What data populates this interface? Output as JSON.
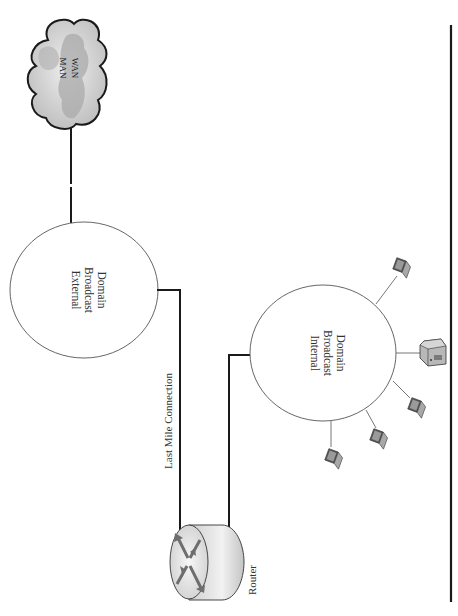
{
  "diagram": {
    "cloud": {
      "lines": [
        "MAN",
        "WAN"
      ]
    },
    "external_domain": {
      "lines": [
        "External",
        "Broadcast",
        "Domain"
      ]
    },
    "internal_domain": {
      "lines": [
        "Internal",
        "Broadcast",
        "Domain"
      ]
    },
    "last_mile_label": "Last Mile Connection",
    "router_label": "Router",
    "devices": [
      {
        "type": "laptop"
      },
      {
        "type": "server"
      },
      {
        "type": "laptop"
      },
      {
        "type": "laptop"
      },
      {
        "type": "laptop"
      }
    ]
  },
  "colors": {
    "line": "#1a1a1a",
    "circle_stroke": "#555555",
    "cloud_fill": "#c8c8c8",
    "cloud_dark": "#a8a8a8",
    "router_body": "#d9d9d9",
    "router_arrow": "#6e6e6e",
    "device_fill": "#9a9a9a"
  }
}
